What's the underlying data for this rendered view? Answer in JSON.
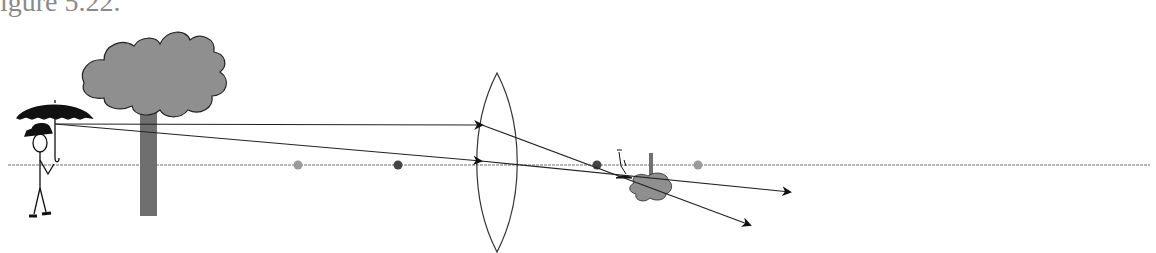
{
  "caption": {
    "text": "igure 5.22."
  },
  "diagram": {
    "colors": {
      "axis": "#9a9a9a",
      "ray": "#222222",
      "near_focal_point": "#444444",
      "far_focal_point": "#9a9a9a",
      "tree_canopy": "#8f8f8f",
      "tree_trunk": "#6f6f6f",
      "umbrella": "#111111"
    },
    "elements": [
      {
        "id": "object-person",
        "label": "stick figure with umbrella and hat"
      },
      {
        "id": "object-tree",
        "label": "tree"
      },
      {
        "id": "lens",
        "label": "biconvex converging lens"
      },
      {
        "id": "focal-points",
        "label": "focal points at f and 2f on each side"
      },
      {
        "id": "image",
        "label": "small inverted image of person and tree"
      },
      {
        "id": "rays",
        "label": "two rays from umbrella top, one parallel to axis and one through lens center"
      }
    ]
  }
}
